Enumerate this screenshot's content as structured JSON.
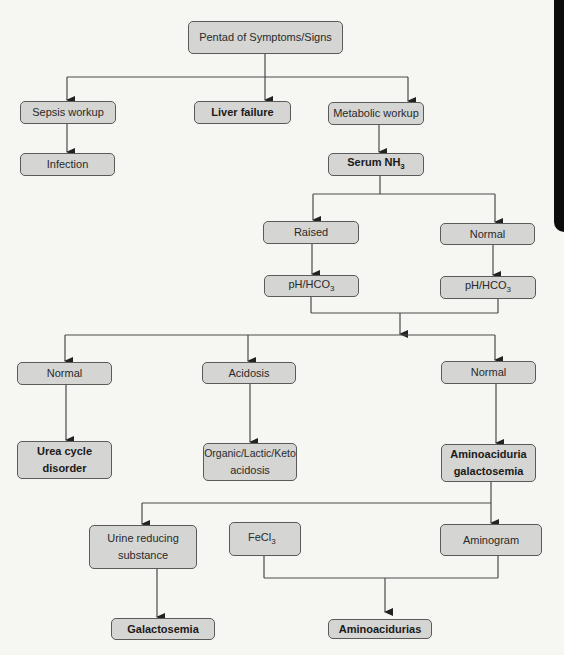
{
  "diagram": {
    "type": "flowchart",
    "root": {
      "label": "Pentad of Symptoms/Signs"
    },
    "level1": {
      "sepsis": "Sepsis workup",
      "liver": "Liver failure",
      "metabolic": "Metabolic workup"
    },
    "level2": {
      "infection": "Infection",
      "serum": "Serum NH",
      "serum_sub": "3"
    },
    "ammonia_branch": {
      "raised": "Raised",
      "normal": "Normal",
      "ph_left": "pH/HCO",
      "ph_left_sub": "3",
      "ph_right": "pH/HCO",
      "ph_right_sub": "3"
    },
    "acid_base": {
      "normal_left": "Normal",
      "acidosis": "Acidosis",
      "normal_right": "Normal"
    },
    "outcomes": {
      "urea_line1": "Urea cycle",
      "urea_line2": "disorder",
      "organic_line1": "Organic/Lactic/Keto",
      "organic_line2": "acidosis",
      "amino_line1": "Aminoaciduria",
      "amino_line2": "galactosemia"
    },
    "tests": {
      "urine_line1": "Urine reducing",
      "urine_line2": "substance",
      "fecl": "FeCl",
      "fecl_sub": "3",
      "aminogram": "Aminogram"
    },
    "final": {
      "galactosemia": "Galactosemia",
      "aminoacidurias": "Aminoacidurias"
    },
    "colors": {
      "background": "#f6f6f3",
      "node_fill": "#d5d5d3",
      "node_border": "#5a5a5a",
      "edge": "#4a4a4a",
      "side_tab": "#0c0c0c"
    }
  }
}
